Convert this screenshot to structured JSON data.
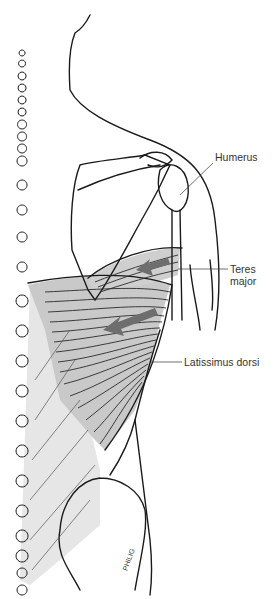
{
  "figure": {
    "labels": {
      "humerus": "Humerus",
      "teres_major_line1": "Teres",
      "teres_major_line2": "major",
      "latissimus_dorsi": "Latissimus dorsi"
    },
    "signature": "PHILIG",
    "colors": {
      "outline": "#1a1a1a",
      "muscle_fill": "#c8c8c8",
      "fascia_fill": "#e6e6e6",
      "arrow": "#6e6e6e",
      "label_text": "#333333"
    }
  }
}
